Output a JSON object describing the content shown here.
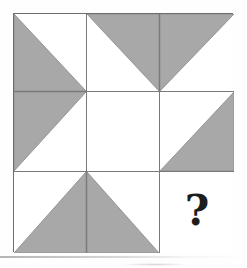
{
  "puzzle": {
    "title": "Shaded Triangle Matrix Puzzle",
    "type": "3x3-visual-analogy-matrix",
    "rows": 3,
    "columns": 3,
    "missing_cell": "row-3-col-3",
    "missing_marker": "?",
    "colors": {
      "shade": "#a8a8a8",
      "shade_edge": "#8f8f8f",
      "grid_line": "#7a7a7a",
      "frame_line": "#6e6e6e",
      "cell_background": "#ffffff",
      "page_background": "#ffffff",
      "marker_color": "#1d1d1d"
    },
    "cells": [
      {
        "id": "cell-r1c1",
        "row": 1,
        "column": 1,
        "name": "top-left-cell",
        "shaded": true,
        "shape": "right-triangle",
        "orientation": "bottom-left",
        "description": "Shaded triangle filling the lower-left half; hypotenuse runs from top-left corner to bottom-right corner.",
        "points": "0,0 0,100 100,100"
      },
      {
        "id": "cell-r1c2",
        "row": 1,
        "column": 2,
        "name": "top-middle-cell",
        "shaded": true,
        "shape": "right-triangle",
        "orientation": "top-right",
        "description": "Shaded triangle filling the upper-right half; hypotenuse runs from bottom-left corner to top-right corner.",
        "points": "0,0 100,0 100,100"
      },
      {
        "id": "cell-r1c3",
        "row": 1,
        "column": 3,
        "name": "top-right-cell",
        "shaded": true,
        "shape": "right-triangle",
        "orientation": "top-left",
        "description": "Shaded triangle filling the upper-left half; hypotenuse runs from bottom-left corner to top-right corner.",
        "points": "0,0 100,0 0,100"
      },
      {
        "id": "cell-r2c1",
        "row": 2,
        "column": 1,
        "name": "middle-left-cell",
        "shaded": true,
        "shape": "right-triangle",
        "orientation": "top-left",
        "description": "Shaded triangle filling the upper-left half; hypotenuse runs from bottom-left corner to top-right corner.",
        "points": "0,0 100,0 0,100"
      },
      {
        "id": "cell-r2c2",
        "row": 2,
        "column": 2,
        "name": "center-cell",
        "shaded": false,
        "shape": "none",
        "orientation": "none",
        "description": "Empty white cell with no shaded region.",
        "points": ""
      },
      {
        "id": "cell-r2c3",
        "row": 2,
        "column": 3,
        "name": "middle-right-cell",
        "shaded": true,
        "shape": "right-triangle",
        "orientation": "bottom-right",
        "description": "Shaded triangle filling the lower-right half; hypotenuse runs from bottom-left corner to top-right corner.",
        "points": "100,0 100,100 0,100"
      },
      {
        "id": "cell-r3c1",
        "row": 3,
        "column": 1,
        "name": "bottom-left-cell",
        "shaded": true,
        "shape": "right-triangle",
        "orientation": "bottom-right",
        "description": "Shaded triangle filling the lower-right half; hypotenuse runs from bottom-left corner to top-right corner.",
        "points": "100,0 100,100 0,100"
      },
      {
        "id": "cell-r3c2",
        "row": 3,
        "column": 2,
        "name": "bottom-middle-cell",
        "shaded": true,
        "shape": "right-triangle",
        "orientation": "bottom-left",
        "description": "Shaded triangle filling the lower-left half; hypotenuse runs from top-left corner to bottom-right corner.",
        "points": "0,0 0,100 100,100"
      },
      {
        "id": "cell-r3c3",
        "row": 3,
        "column": 3,
        "name": "answer-cell",
        "shaded": false,
        "shape": "question-mark",
        "orientation": "none",
        "description": "Blank cell containing a bold question mark marking the missing element.",
        "points": "",
        "marker": "?"
      }
    ]
  }
}
